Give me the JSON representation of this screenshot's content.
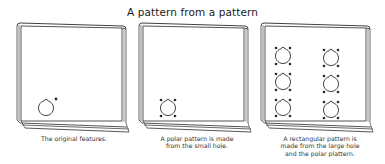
{
  "title": "A pattern from a pattern",
  "panels": [
    {
      "id": "original",
      "caption_lines": [
        "The original features."
      ],
      "holes": [
        {
          "cx": 46,
          "cy": 108,
          "dots": "single"
        }
      ]
    },
    {
      "id": "polar",
      "caption_lines": [
        "A polar pattern is made",
        "from the small hole."
      ],
      "holes": [
        {
          "cx": 168,
          "cy": 108,
          "dots": "polar-4"
        }
      ]
    },
    {
      "id": "rectangular",
      "caption_lines": [
        "A rectangular pattern is",
        "made from the large hole",
        "and the polar plattern."
      ],
      "holes": [
        {
          "cx": 283,
          "cy": 56,
          "dots": "polar-4"
        },
        {
          "cx": 331,
          "cy": 58,
          "dots": "polar-4"
        },
        {
          "cx": 283,
          "cy": 82,
          "dots": "polar-4"
        },
        {
          "cx": 331,
          "cy": 84,
          "dots": "polar-4"
        },
        {
          "cx": 283,
          "cy": 108,
          "dots": "polar-4"
        },
        {
          "cx": 331,
          "cy": 110,
          "dots": "polar-4"
        }
      ]
    }
  ],
  "colors": {
    "line": "#2a2a2a",
    "background": "#ffffff"
  }
}
